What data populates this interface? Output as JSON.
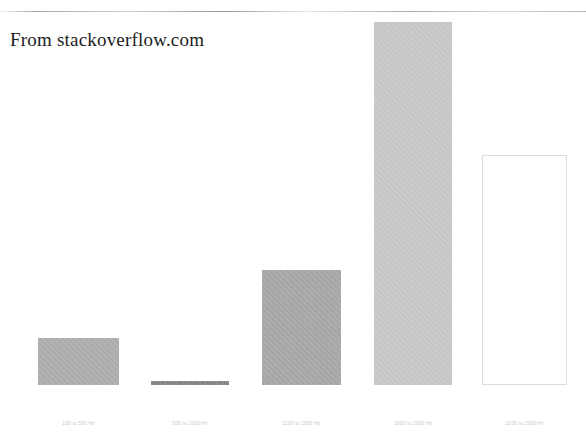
{
  "slide": {
    "title": "From stackoverflow.com",
    "background_color": "#ffffff",
    "top_rule_color": "#9b9b9b"
  },
  "chart_data": {
    "type": "bar",
    "title": "From stackoverflow.com",
    "xlabel": "",
    "ylabel": "",
    "grid": false,
    "legend": false,
    "categories": [
      "150 to 500 Hz",
      "500 to 1000 Hz",
      "1100 to 1500 Hz",
      "1600 to 2000 Hz",
      "2100 to 2500 Hz"
    ],
    "values": [
      47,
      4,
      115,
      363,
      230
    ],
    "value_unit": "px-height (unlabeled axis)",
    "ylim": [
      0,
      380
    ],
    "bar_colors": [
      "#a3a3a3",
      "#6d6d6d",
      "#9b9b9b",
      "#c6c6c6",
      "#ffffff"
    ],
    "bar_edge_colors": [
      "#a3a3a3",
      "#6d6d6d",
      "#9b9b9b",
      "#c6c6c6",
      "#dcdcdc"
    ],
    "bars": [
      {
        "label": "150 to 500 Hz",
        "value": 47,
        "left": 38,
        "width": 81,
        "height": 47,
        "fill": "#a3a3a3",
        "edge": "#a3a3a3",
        "filled": true
      },
      {
        "label": "500 to 1000 Hz",
        "value": 4,
        "left": 151,
        "width": 78,
        "height": 4,
        "fill": "#6d6d6d",
        "edge": "#6d6d6d",
        "filled": true
      },
      {
        "label": "1100 to 1500 Hz",
        "value": 115,
        "left": 262,
        "width": 79,
        "height": 115,
        "fill": "#9b9b9b",
        "edge": "#9b9b9b",
        "filled": true
      },
      {
        "label": "1600 to 2000 Hz",
        "value": 363,
        "left": 374,
        "width": 78,
        "height": 363,
        "fill": "#c6c6c6",
        "edge": "#c6c6c6",
        "filled": true
      },
      {
        "label": "2100 to 2500 Hz",
        "value": 230,
        "left": 482,
        "width": 85,
        "height": 230,
        "fill": "#ffffff",
        "edge": "#dcdcdc",
        "filled": false
      }
    ],
    "tick_label_color": "#c9c9c9",
    "baseline_y": 385
  }
}
